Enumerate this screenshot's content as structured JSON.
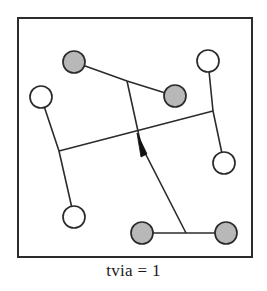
{
  "figure": {
    "caption": "tvia = 1",
    "border": {
      "x": 18,
      "y": 18,
      "width": 234,
      "height": 239,
      "stroke": "#2b2b2b",
      "stroke_width": 2,
      "fill": "#ffffff"
    },
    "colors": {
      "line": "#2b2b2b",
      "terminal_filled": "#b8b8b8",
      "terminal_empty": "#ffffff",
      "terminal_stroke": "#2b2b2b",
      "via_marker": "#111111",
      "background": "#ffffff"
    },
    "terminal_radius": 11,
    "terminals": [
      {
        "id": "t1",
        "cx": 74,
        "cy": 62,
        "fill": "filled",
        "label": "top-left-filled"
      },
      {
        "id": "t2",
        "cx": 175,
        "cy": 96,
        "fill": "filled",
        "label": "upper-mid-filled"
      },
      {
        "id": "t3",
        "cx": 208,
        "cy": 61,
        "fill": "empty",
        "label": "top-right-empty"
      },
      {
        "id": "t4",
        "cx": 41,
        "cy": 97,
        "fill": "empty",
        "label": "left-upper-empty"
      },
      {
        "id": "t5",
        "cx": 224,
        "cy": 163,
        "fill": "empty",
        "label": "right-mid-empty"
      },
      {
        "id": "t6",
        "cx": 74,
        "cy": 217,
        "fill": "empty",
        "label": "bottom-left-empty"
      },
      {
        "id": "t7",
        "cx": 142,
        "cy": 233,
        "fill": "filled",
        "label": "bottom-mid-filled"
      },
      {
        "id": "t8",
        "cx": 226,
        "cy": 233,
        "fill": "filled",
        "label": "bottom-right-filled"
      }
    ],
    "nets": [
      {
        "id": "net-a",
        "name": "net-top-filled-pair",
        "points": [
          [
            74,
            62
          ],
          [
            127,
            81
          ],
          [
            175,
            96
          ]
        ]
      },
      {
        "id": "net-b",
        "name": "net-vertical-long",
        "points": [
          [
            127,
            81
          ],
          [
            141,
            145
          ],
          [
            186,
            233
          ]
        ]
      },
      {
        "id": "net-c",
        "name": "net-left-vertical",
        "points": [
          [
            41,
            97
          ],
          [
            59,
            151
          ],
          [
            74,
            217
          ]
        ]
      },
      {
        "id": "net-d",
        "name": "net-horizontal-span",
        "points": [
          [
            59,
            151
          ],
          [
            213,
            111
          ]
        ]
      },
      {
        "id": "net-e",
        "name": "net-right-vertical",
        "points": [
          [
            208,
            61
          ],
          [
            213,
            111
          ],
          [
            224,
            163
          ]
        ]
      },
      {
        "id": "net-f",
        "name": "net-bottom-horizontal",
        "points": [
          [
            142,
            233
          ],
          [
            186,
            233
          ],
          [
            226,
            233
          ]
        ]
      }
    ],
    "via_markers": [
      {
        "id": "via-1",
        "name": "via-wedge",
        "apex": [
          137,
          133
        ],
        "base_left": [
          141,
          157
        ],
        "base_right": [
          147,
          154
        ]
      }
    ]
  }
}
